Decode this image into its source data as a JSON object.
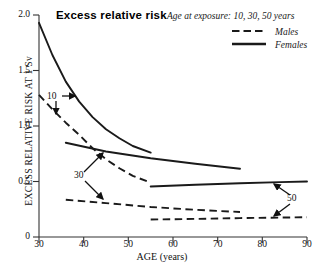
{
  "chart_data": {
    "type": "line",
    "title": "Excess relative risk",
    "xlabel": "AGE (years)",
    "ylabel": "EXCESS RELATIVE RISK AT 1 Sv",
    "xlim": [
      30,
      90
    ],
    "ylim": [
      0,
      2.0
    ],
    "xticks": [
      "30",
      "40",
      "50",
      "60",
      "70",
      "80",
      "90"
    ],
    "yticks": [
      "0",
      "0.5",
      "1.0",
      "1.5",
      "2.0"
    ],
    "grid": false,
    "legend_position": "top-right",
    "legend_heading": "Age at exposure: 10, 30, 50 years",
    "legend_entries": [
      {
        "label": "Males",
        "style": "dashed"
      },
      {
        "label": "Females",
        "style": "solid"
      }
    ],
    "annotations": [
      {
        "label": "10",
        "x": 34.5,
        "y": 1.22
      },
      {
        "label": "30",
        "x": 40.5,
        "y": 0.52
      },
      {
        "label": "50",
        "x": 86.5,
        "y": 0.3
      }
    ],
    "series": [
      {
        "name": "Females, age at exposure 10",
        "sex": "Females",
        "age_at_exposure": 10,
        "style": "solid",
        "points": [
          [
            30,
            1.93
          ],
          [
            33,
            1.64
          ],
          [
            36,
            1.4
          ],
          [
            39,
            1.22
          ],
          [
            42,
            1.08
          ],
          [
            45,
            0.97
          ],
          [
            48,
            0.89
          ],
          [
            51,
            0.82
          ],
          [
            55,
            0.76
          ]
        ]
      },
      {
        "name": "Males, age at exposure 10",
        "sex": "Males",
        "age_at_exposure": 10,
        "style": "dashed",
        "points": [
          [
            30,
            1.28
          ],
          [
            33,
            1.15
          ],
          [
            36,
            1.03
          ],
          [
            39,
            0.92
          ],
          [
            42,
            0.8
          ],
          [
            45,
            0.7
          ],
          [
            48,
            0.62
          ],
          [
            51,
            0.55
          ],
          [
            55,
            0.49
          ]
        ]
      },
      {
        "name": "Females, age at exposure 30",
        "sex": "Females",
        "age_at_exposure": 30,
        "style": "solid",
        "points": [
          [
            36,
            0.85
          ],
          [
            45,
            0.77
          ],
          [
            55,
            0.71
          ],
          [
            65,
            0.66
          ],
          [
            75,
            0.615
          ]
        ]
      },
      {
        "name": "Males, age at exposure 30",
        "sex": "Males",
        "age_at_exposure": 30,
        "style": "dashed",
        "points": [
          [
            36,
            0.335
          ],
          [
            45,
            0.305
          ],
          [
            55,
            0.27
          ],
          [
            65,
            0.245
          ],
          [
            75,
            0.225
          ]
        ]
      },
      {
        "name": "Females, age at exposure 50",
        "sex": "Females",
        "age_at_exposure": 50,
        "style": "solid",
        "points": [
          [
            55,
            0.455
          ],
          [
            65,
            0.47
          ],
          [
            75,
            0.485
          ],
          [
            84,
            0.495
          ],
          [
            90,
            0.5
          ]
        ]
      },
      {
        "name": "Males, age at exposure 50",
        "sex": "Males",
        "age_at_exposure": 50,
        "style": "dashed",
        "points": [
          [
            55,
            0.158
          ],
          [
            65,
            0.163
          ],
          [
            75,
            0.17
          ],
          [
            84,
            0.175
          ],
          [
            90,
            0.178
          ]
        ]
      }
    ],
    "colors": {
      "line": "#1a1a1a",
      "axis": "#333333",
      "background": "#ffffff"
    }
  }
}
